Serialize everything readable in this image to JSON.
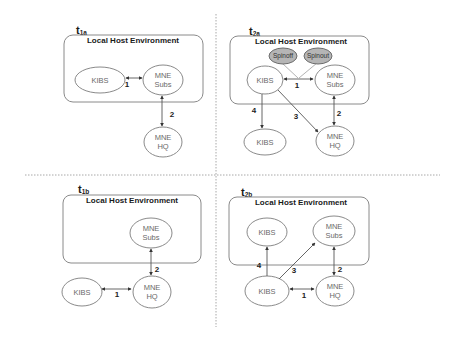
{
  "diagram": {
    "env_title": "Local Host Environment",
    "panels": [
      {
        "id": "t1a",
        "label_main": "t",
        "label_sub": "1a",
        "nodes": {
          "kibs": "KIBS",
          "mne_subs_line1": "MNE",
          "mne_subs_line2": "Subs",
          "mne_hq_line1": "MNE",
          "mne_hq_line2": "HQ"
        },
        "edges": [
          {
            "label": "1",
            "from": "KIBS",
            "to": "MNE Subs",
            "direction": "bidirectional"
          },
          {
            "label": "2",
            "from": "MNE Subs",
            "to": "MNE HQ",
            "direction": "bidirectional"
          }
        ]
      },
      {
        "id": "t2a",
        "label_main": "t",
        "label_sub": "2a",
        "nodes": {
          "spinoff": "Spinoff",
          "spinout": "Spinout",
          "kibs": "KIBS",
          "mne_subs_line1": "MNE",
          "mne_subs_line2": "Subs",
          "kibs_external": "KIBS",
          "mne_hq_line1": "MNE",
          "mne_hq_line2": "HQ"
        },
        "edges": [
          {
            "label": "1",
            "from": "KIBS",
            "to": "MNE Subs",
            "direction": "bidirectional"
          },
          {
            "label": "2",
            "from": "MNE Subs",
            "to": "MNE HQ",
            "direction": "bidirectional"
          },
          {
            "label": "3",
            "from": "KIBS",
            "to": "MNE HQ",
            "direction": "forward"
          },
          {
            "label": "4",
            "from": "KIBS",
            "to": "KIBS (external)",
            "direction": "forward"
          }
        ]
      },
      {
        "id": "t1b",
        "label_main": "t",
        "label_sub": "1b",
        "nodes": {
          "mne_subs_line1": "MNE",
          "mne_subs_line2": "Subs",
          "kibs": "KIBS",
          "mne_hq_line1": "MNE",
          "mne_hq_line2": "HQ"
        },
        "edges": [
          {
            "label": "1",
            "from": "KIBS",
            "to": "MNE HQ",
            "direction": "bidirectional"
          },
          {
            "label": "2",
            "from": "MNE Subs",
            "to": "MNE HQ",
            "direction": "bidirectional"
          }
        ]
      },
      {
        "id": "t2b",
        "label_main": "t",
        "label_sub": "2b",
        "nodes": {
          "kibs_local": "KIBS",
          "mne_subs_line1": "MNE",
          "mne_subs_line2": "Subs",
          "kibs": "KIBS",
          "mne_hq_line1": "MNE",
          "mne_hq_line2": "HQ"
        },
        "edges": [
          {
            "label": "1",
            "from": "KIBS",
            "to": "MNE HQ",
            "direction": "bidirectional"
          },
          {
            "label": "2",
            "from": "MNE Subs",
            "to": "MNE HQ",
            "direction": "bidirectional"
          },
          {
            "label": "3",
            "from": "KIBS",
            "to": "MNE Subs",
            "direction": "forward"
          },
          {
            "label": "4",
            "from": "KIBS",
            "to": "KIBS (local)",
            "direction": "forward"
          }
        ]
      }
    ]
  }
}
